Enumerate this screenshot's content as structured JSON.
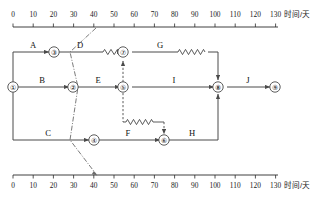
{
  "diagram": {
    "kind": "time-scaled-activity-on-arrow-network",
    "axis": {
      "title": "时间/天",
      "min": 0,
      "max": 130,
      "step": 10,
      "tick_labels": [
        "0",
        "10",
        "20",
        "30",
        "40",
        "50",
        "60",
        "70",
        "80",
        "90",
        "100",
        "110",
        "120",
        "130"
      ],
      "top_title": "时间/天",
      "bottom_title": "时间/天"
    },
    "nodes": [
      {
        "id": "1",
        "glyph": "①",
        "day": 0,
        "row": "middle"
      },
      {
        "id": "2",
        "glyph": "②",
        "day": 30,
        "row": "middle"
      },
      {
        "id": "3",
        "glyph": "③",
        "day": 20,
        "row": "top"
      },
      {
        "id": "4",
        "glyph": "④",
        "day": 40,
        "row": "bottom"
      },
      {
        "id": "5",
        "glyph": "⑤",
        "day": 60,
        "row": "middle"
      },
      {
        "id": "6",
        "glyph": "⑥",
        "day": 80,
        "row": "bottom"
      },
      {
        "id": "7",
        "glyph": "⑦",
        "day": 60,
        "row": "top"
      },
      {
        "id": "8",
        "glyph": "⑧",
        "day": 110,
        "row": "middle"
      },
      {
        "id": "9",
        "glyph": "⑨",
        "day": 130,
        "row": "middle"
      }
    ],
    "activities": [
      {
        "label": "A",
        "from": "1",
        "to": "3",
        "label_day": 13
      },
      {
        "label": "B",
        "from": "1",
        "to": "2",
        "label_day": 15
      },
      {
        "label": "C",
        "from": "1",
        "to": "4",
        "label_day": 17
      },
      {
        "label": "D",
        "from": "3",
        "to": "7",
        "label_day": 33,
        "has_float": true
      },
      {
        "label": "E",
        "from": "2",
        "to": "5",
        "label_day": 42
      },
      {
        "label": "F",
        "from": "4",
        "to": "6",
        "label_day": 62
      },
      {
        "label": "G",
        "from": "7",
        "to": "8",
        "label_day": 75,
        "has_float": true
      },
      {
        "label": "H",
        "from": "6",
        "to": "8",
        "label_day": 96
      },
      {
        "label": "I",
        "from": "5",
        "to": "8",
        "label_day": 88
      },
      {
        "label": "J",
        "from": "8",
        "to": "9",
        "label_day": 120
      }
    ],
    "dummies": [
      {
        "from": "5",
        "to": "7",
        "style": "dashed-vertical"
      },
      {
        "from": "5",
        "to": "6",
        "style": "dashed-with-float"
      }
    ],
    "status_line": {
      "day": 40,
      "style": "dash-dot"
    }
  }
}
